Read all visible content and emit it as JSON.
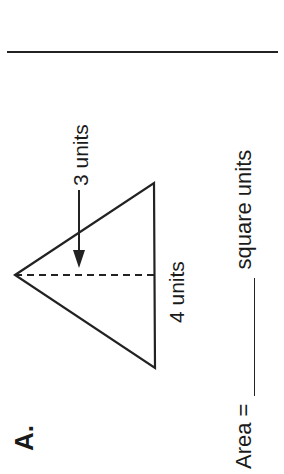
{
  "problem": {
    "letter": "A.",
    "shape": "triangle",
    "height_label": "3 units",
    "base_label": "4 units",
    "area_prefix": "Area =",
    "area_answer": "",
    "area_suffix": "square units"
  },
  "figure": {
    "stroke_color": "#222222",
    "apex": [
      15,
      275
    ],
    "top_vertex": [
      154,
      183
    ],
    "bottom_vertex": [
      155,
      368
    ],
    "height_line_dashed": true,
    "arrow": {
      "x": 79,
      "from_y": 190,
      "to_y": 268
    }
  }
}
